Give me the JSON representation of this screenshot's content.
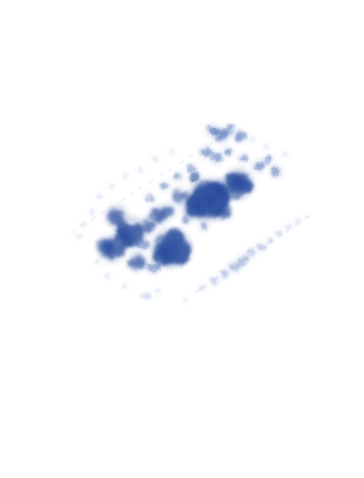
{
  "image": {
    "kind": "microscopy-micrograph",
    "modality": "brightfield-light-microscopy",
    "specimen": "stained-cell-smear",
    "stain_family": "romanowsky-methylene-blue",
    "caption": "Blue-stained cell smear on a white slide background",
    "width": 364,
    "height": 478,
    "background_color": "#ffffff",
    "has_text_labels": false,
    "has_scale_bar": false,
    "has_borders": false
  },
  "palette": {
    "background": "#ffffff",
    "stain_core_darkest": "#2a4a9e",
    "stain_core_dark": "#33539f",
    "stain_mid": "#4a6ab5",
    "stain_light": "#8098d4",
    "stain_pale": "#b8c8e8",
    "stain_faintest": "#dfe7f5",
    "streak_line": "#cfdaef"
  },
  "composition": {
    "smear_axis_description": "diagonal band running from lower-left to upper-right",
    "smear_angle_degrees": -27,
    "dense_zone_center": {
      "x": 185,
      "y": 205
    },
    "blank_regions": [
      "top-margin",
      "bottom-half",
      "left-margin",
      "right-margin"
    ],
    "streak_lines": [
      {
        "name": "upper-feathered-edge",
        "x1": 72,
        "y1": 232,
        "x2": 235,
        "y2": 128,
        "opacity": 0.3
      },
      {
        "name": "lower-feathered-edge",
        "x1": 196,
        "y1": 292,
        "x2": 312,
        "y2": 214,
        "opacity": 0.34
      }
    ]
  },
  "chart_data": {
    "type": "scatter",
    "xlabel": "x (pixels)",
    "ylabel": "y (pixels)",
    "xlim": [
      0,
      364
    ],
    "ylim": [
      478,
      0
    ],
    "grid": false,
    "legend": "none",
    "series": [
      {
        "name": "dense-cell-clusters",
        "color": "#33539f",
        "points": [
          {
            "x": 208,
            "y": 200,
            "r": 15,
            "intensity": 0.96
          },
          {
            "x": 196,
            "y": 206,
            "r": 10,
            "intensity": 0.9
          },
          {
            "x": 219,
            "y": 191,
            "r": 9,
            "intensity": 0.88
          },
          {
            "x": 238,
            "y": 184,
            "r": 11,
            "intensity": 0.9
          },
          {
            "x": 240,
            "y": 182,
            "r": 7,
            "intensity": 0.84
          },
          {
            "x": 222,
            "y": 211,
            "r": 7,
            "intensity": 0.8
          },
          {
            "x": 172,
            "y": 248,
            "r": 14,
            "intensity": 0.93
          },
          {
            "x": 164,
            "y": 254,
            "r": 9,
            "intensity": 0.86
          },
          {
            "x": 131,
            "y": 232,
            "r": 11,
            "intensity": 0.86
          },
          {
            "x": 124,
            "y": 238,
            "r": 8,
            "intensity": 0.8
          },
          {
            "x": 117,
            "y": 216,
            "r": 8,
            "intensity": 0.78
          },
          {
            "x": 112,
            "y": 250,
            "r": 9,
            "intensity": 0.82
          },
          {
            "x": 106,
            "y": 246,
            "r": 7,
            "intensity": 0.76
          },
          {
            "x": 137,
            "y": 262,
            "r": 7,
            "intensity": 0.74
          },
          {
            "x": 148,
            "y": 225,
            "r": 6,
            "intensity": 0.72
          },
          {
            "x": 158,
            "y": 216,
            "r": 7,
            "intensity": 0.74
          },
          {
            "x": 168,
            "y": 211,
            "r": 6,
            "intensity": 0.7
          },
          {
            "x": 180,
            "y": 196,
            "r": 6,
            "intensity": 0.68
          },
          {
            "x": 195,
            "y": 178,
            "r": 5,
            "intensity": 0.66
          }
        ]
      },
      {
        "name": "scattered-small-cells",
        "color": "#4a6ab5",
        "points": [
          {
            "x": 212,
            "y": 130,
            "r": 5,
            "intensity": 0.66
          },
          {
            "x": 222,
            "y": 135,
            "r": 6,
            "intensity": 0.7
          },
          {
            "x": 231,
            "y": 129,
            "r": 4,
            "intensity": 0.6
          },
          {
            "x": 240,
            "y": 136,
            "r": 5,
            "intensity": 0.62
          },
          {
            "x": 206,
            "y": 152,
            "r": 5,
            "intensity": 0.62
          },
          {
            "x": 217,
            "y": 158,
            "r": 5,
            "intensity": 0.6
          },
          {
            "x": 228,
            "y": 152,
            "r": 4,
            "intensity": 0.56
          },
          {
            "x": 243,
            "y": 158,
            "r": 4,
            "intensity": 0.56
          },
          {
            "x": 258,
            "y": 166,
            "r": 5,
            "intensity": 0.58
          },
          {
            "x": 268,
            "y": 160,
            "r": 4,
            "intensity": 0.52
          },
          {
            "x": 276,
            "y": 171,
            "r": 5,
            "intensity": 0.56
          },
          {
            "x": 191,
            "y": 168,
            "r": 4,
            "intensity": 0.54
          },
          {
            "x": 178,
            "y": 177,
            "r": 4,
            "intensity": 0.52
          },
          {
            "x": 165,
            "y": 186,
            "r": 4,
            "intensity": 0.5
          },
          {
            "x": 150,
            "y": 198,
            "r": 4,
            "intensity": 0.48
          },
          {
            "x": 143,
            "y": 244,
            "r": 5,
            "intensity": 0.58
          },
          {
            "x": 154,
            "y": 268,
            "r": 5,
            "intensity": 0.56
          },
          {
            "x": 186,
            "y": 220,
            "r": 4,
            "intensity": 0.5
          },
          {
            "x": 204,
            "y": 226,
            "r": 4,
            "intensity": 0.48
          }
        ]
      },
      {
        "name": "faint-peripheral-specks",
        "color": "#9db2dd",
        "points": [
          {
            "x": 92,
            "y": 212,
            "r": 3,
            "intensity": 0.34
          },
          {
            "x": 84,
            "y": 224,
            "r": 3,
            "intensity": 0.3
          },
          {
            "x": 78,
            "y": 236,
            "r": 3,
            "intensity": 0.28
          },
          {
            "x": 100,
            "y": 196,
            "r": 3,
            "intensity": 0.32
          },
          {
            "x": 112,
            "y": 186,
            "r": 3,
            "intensity": 0.3
          },
          {
            "x": 126,
            "y": 176,
            "r": 3,
            "intensity": 0.3
          },
          {
            "x": 140,
            "y": 170,
            "r": 3,
            "intensity": 0.28
          },
          {
            "x": 156,
            "y": 160,
            "r": 3,
            "intensity": 0.28
          },
          {
            "x": 172,
            "y": 152,
            "r": 3,
            "intensity": 0.26
          },
          {
            "x": 252,
            "y": 140,
            "r": 3,
            "intensity": 0.28
          },
          {
            "x": 266,
            "y": 146,
            "r": 3,
            "intensity": 0.26
          },
          {
            "x": 284,
            "y": 154,
            "r": 3,
            "intensity": 0.24
          },
          {
            "x": 98,
            "y": 262,
            "r": 3,
            "intensity": 0.28
          },
          {
            "x": 108,
            "y": 276,
            "r": 3,
            "intensity": 0.26
          },
          {
            "x": 126,
            "y": 286,
            "r": 3,
            "intensity": 0.26
          },
          {
            "x": 146,
            "y": 296,
            "r": 4,
            "intensity": 0.4
          },
          {
            "x": 158,
            "y": 292,
            "r": 3,
            "intensity": 0.28
          },
          {
            "x": 186,
            "y": 300,
            "r": 3,
            "intensity": 0.22
          }
        ]
      },
      {
        "name": "lower-right-cell-trail",
        "color": "#7b94cc",
        "points": [
          {
            "x": 203,
            "y": 288,
            "r": 3,
            "intensity": 0.34
          },
          {
            "x": 214,
            "y": 281,
            "r": 4,
            "intensity": 0.42
          },
          {
            "x": 224,
            "y": 274,
            "r": 4,
            "intensity": 0.44
          },
          {
            "x": 234,
            "y": 267,
            "r": 5,
            "intensity": 0.52
          },
          {
            "x": 243,
            "y": 260,
            "r": 5,
            "intensity": 0.54
          },
          {
            "x": 252,
            "y": 253,
            "r": 4,
            "intensity": 0.46
          },
          {
            "x": 261,
            "y": 247,
            "r": 4,
            "intensity": 0.42
          },
          {
            "x": 270,
            "y": 240,
            "r": 3,
            "intensity": 0.36
          },
          {
            "x": 279,
            "y": 233,
            "r": 3,
            "intensity": 0.32
          },
          {
            "x": 288,
            "y": 227,
            "r": 3,
            "intensity": 0.28
          },
          {
            "x": 297,
            "y": 221,
            "r": 3,
            "intensity": 0.24
          },
          {
            "x": 306,
            "y": 216,
            "r": 2,
            "intensity": 0.2
          }
        ]
      }
    ]
  }
}
